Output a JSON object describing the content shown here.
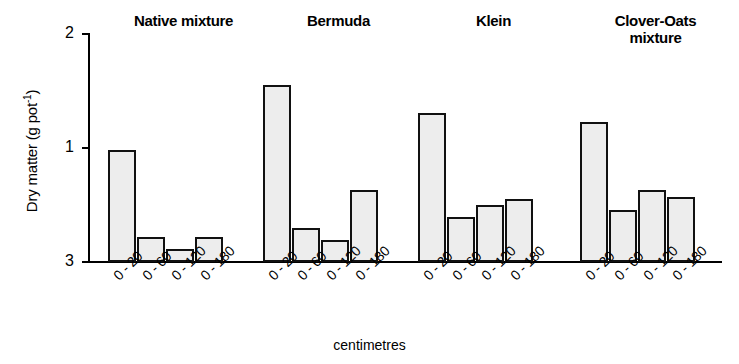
{
  "chart_data": {
    "type": "bar",
    "title": "",
    "xlabel": "centimetres",
    "ylabel": "Dry matter (g pot-1)",
    "ylabel_base": "Dry matter (g pot",
    "ylabel_sup": "-1",
    "ylabel_tail": ")",
    "categories": [
      "0 - 20",
      "0 - 60",
      "0 - 120",
      "0 - 180"
    ],
    "ytick_labels": [
      "2",
      "1",
      "3"
    ],
    "ytick_values": [
      2,
      1,
      0
    ],
    "ylim": [
      0,
      2
    ],
    "grid": false,
    "legend": "none",
    "series": [
      {
        "name": "Native mixture",
        "values": [
          0.98,
          0.22,
          0.11,
          0.22
        ]
      },
      {
        "name": "Bermuda",
        "values": [
          1.55,
          0.3,
          0.19,
          0.63
        ]
      },
      {
        "name": "Klein",
        "values": [
          1.3,
          0.39,
          0.5,
          0.55
        ]
      },
      {
        "name": "Clover-Oats mixture",
        "values": [
          1.22,
          0.45,
          0.63,
          0.57
        ]
      }
    ],
    "group_titles": [
      {
        "line1": "Native mixture",
        "line2": ""
      },
      {
        "line1": "Bermuda",
        "line2": ""
      },
      {
        "line1": "Klein",
        "line2": ""
      },
      {
        "line1": "Clover-Oats",
        "line2": "mixture"
      }
    ]
  }
}
